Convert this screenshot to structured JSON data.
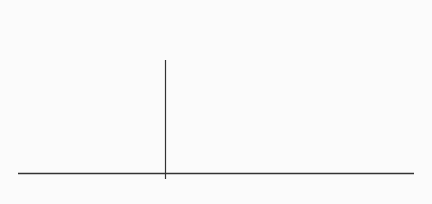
{
  "diagram": {
    "type": "normal-distribution-cdf",
    "shaded_label": "Probability",
    "x_marker_label": "z",
    "colors": {
      "curve": "#222222",
      "shade": "#c4c4c4",
      "background": "#fbfbfb"
    }
  }
}
